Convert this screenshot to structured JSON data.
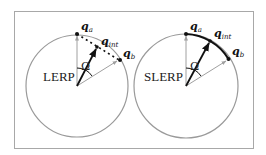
{
  "panels": [
    {
      "id": "lerp",
      "mode_label": "LERP",
      "angle_label": "Ω",
      "points": {
        "qa": {
          "base": "q",
          "sub": "a"
        },
        "qint": {
          "base": "q",
          "sub": "int"
        },
        "qb": {
          "base": "q",
          "sub": "b"
        }
      },
      "interpolation_path": "dotted-chord"
    },
    {
      "id": "slerp",
      "mode_label": "SLERP",
      "angle_label": "Ω",
      "points": {
        "qa": {
          "base": "q",
          "sub": "a"
        },
        "qint": {
          "base": "q",
          "sub": "int"
        },
        "qb": {
          "base": "q",
          "sub": "b"
        }
      },
      "interpolation_path": "solid-arc"
    }
  ],
  "colors": {
    "circle": "#9a9a9a",
    "frame": "#a8a8a8",
    "vector_light": "#a0a0a0",
    "vector_dark": "#111111",
    "arc": "#111111"
  }
}
